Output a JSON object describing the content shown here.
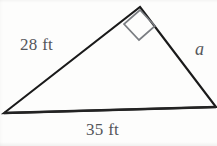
{
  "figure": {
    "kind": "right-triangle-diagram",
    "background_color": "#fdfdfc",
    "stroke_color": "#1a1a1a",
    "right_angle_marker_color": "#6e7176",
    "label_color": "#54565a"
  },
  "labels": {
    "side_left": "28 ft",
    "side_right": "a",
    "side_bottom": "35 ft"
  },
  "geometry": {
    "vertices": {
      "apex": {
        "x": 140,
        "y": 7
      },
      "bottom_left": {
        "x": 4,
        "y": 113
      },
      "bottom_right": {
        "x": 216,
        "y": 107
      }
    },
    "right_angle_marker": {
      "at": "apex",
      "points": "140,9 156,26 139,40 124,24",
      "size_px": 22
    },
    "stroke_width": 2.1
  }
}
